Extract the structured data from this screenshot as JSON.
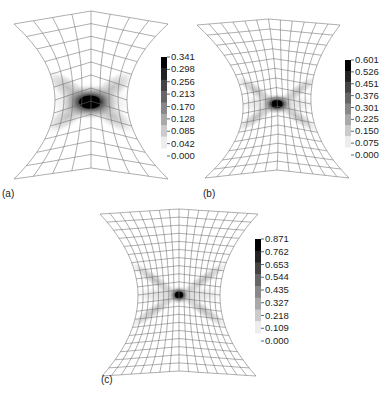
{
  "figure": {
    "panels": [
      {
        "id": "a",
        "label": "(a)",
        "label_pos": [
          2,
          188
        ],
        "grid": {
          "cols": 8,
          "rows": 12
        },
        "center_x": 91,
        "top_corners": [
          [
            14,
            24
          ],
          [
            168,
            24
          ]
        ],
        "top_mid_y": 11,
        "bottom_corners": [
          [
            14,
            179
          ],
          [
            168,
            179
          ]
        ],
        "bottom_mid_y": 168,
        "waist_y": 100,
        "waist_half_width": 36,
        "hot_spot": [
          90,
          102
        ],
        "hot_spread": [
          22,
          12
        ],
        "x_arms": true,
        "colorbar": {
          "x": 161,
          "y": 57,
          "width": 6,
          "height": 91,
          "min": 0.0,
          "max": 0.341,
          "ticks": [
            "0.341",
            "0.298",
            "0.256",
            "0.213",
            "0.170",
            "0.128",
            "0.085",
            "0.042",
            "0.000"
          ]
        }
      },
      {
        "id": "b",
        "label": "(b)",
        "label_pos": [
          203,
          188
        ],
        "grid": {
          "cols": 12,
          "rows": 16
        },
        "center_x": 277,
        "top_corners": [
          [
            197,
            25
          ],
          [
            340,
            25
          ]
        ],
        "top_mid_y": 19,
        "bottom_corners": [
          [
            205,
            178
          ],
          [
            349,
            178
          ]
        ],
        "bottom_mid_y": 170,
        "waist_y": 104,
        "waist_half_width": 34,
        "hot_spot": [
          277,
          104
        ],
        "hot_spread": [
          12,
          7
        ],
        "x_arms": true,
        "colorbar": {
          "x": 345,
          "y": 60,
          "width": 6,
          "height": 87,
          "min": 0.0,
          "max": 0.601,
          "ticks": [
            "0.601",
            "0.526",
            "0.451",
            "0.376",
            "0.301",
            "0.225",
            "0.150",
            "0.075",
            "0.000"
          ]
        }
      },
      {
        "id": "c",
        "label": "(c)",
        "label_pos": [
          101,
          374
        ],
        "grid": {
          "cols": 16,
          "rows": 20
        },
        "center_x": 179,
        "top_corners": [
          [
            100,
            214
          ],
          [
            258,
            214
          ]
        ],
        "top_mid_y": 209,
        "bottom_corners": [
          [
            102,
            376
          ],
          [
            256,
            376
          ]
        ],
        "bottom_mid_y": 371,
        "waist_y": 295,
        "waist_half_width": 41,
        "hot_spot": [
          179,
          295
        ],
        "hot_spread": [
          8,
          6
        ],
        "x_arms": true,
        "colorbar": {
          "x": 255,
          "y": 239,
          "width": 6,
          "height": 94,
          "min": 0.0,
          "max": 0.871,
          "ticks": [
            "0.871",
            "0.762",
            "0.653",
            "0.544",
            "0.435",
            "0.327",
            "0.218",
            "0.109",
            "0.000"
          ]
        }
      }
    ],
    "colors": {
      "mesh_line": "#6b6b6b",
      "background": "#ffffff",
      "colormap_low": "#ffffff",
      "colormap_high": "#000000",
      "text": "#222222"
    }
  }
}
